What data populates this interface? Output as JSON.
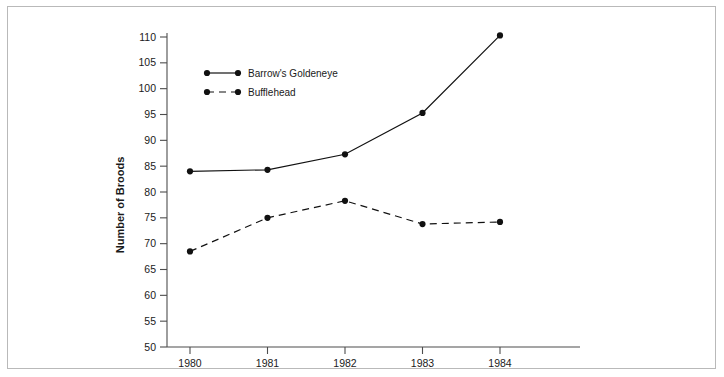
{
  "figure": {
    "background_color": "#ffffff",
    "frame_color": "#b9b9b9",
    "ink_color": "#111111"
  },
  "chart_data": {
    "type": "line",
    "title": "",
    "xlabel": "",
    "ylabel": "Number of Broods",
    "x": [
      1980,
      1981,
      1982,
      1983,
      1984
    ],
    "categories": [
      "1980",
      "1981",
      "1982",
      "1983",
      "1984"
    ],
    "xlim": [
      1979.55,
      1985.05
    ],
    "ylim": [
      50,
      112
    ],
    "yticks": [
      50,
      55,
      60,
      65,
      70,
      75,
      80,
      85,
      90,
      95,
      100,
      105,
      110
    ],
    "ytick_labels": [
      "50",
      "55",
      "60",
      "65",
      "70",
      "75",
      "80",
      "85",
      "90",
      "95",
      "100",
      "105",
      "110"
    ],
    "xticks": [
      1980,
      1981,
      1982,
      1983,
      1984
    ],
    "xtick_labels": [
      "1980",
      "1981",
      "1982",
      "1983",
      "1984"
    ],
    "grid": false,
    "legend_position": "upper left inside",
    "series": [
      {
        "name": "Barrow's Goldeneye",
        "linestyle": "solid",
        "marker": "filled-circle",
        "color": "#111111",
        "values": [
          84.0,
          84.3,
          87.3,
          95.3,
          110.3
        ]
      },
      {
        "name": "Bufflehead",
        "linestyle": "dashed",
        "marker": "filled-circle",
        "color": "#111111",
        "values": [
          68.5,
          75.0,
          78.3,
          73.8,
          74.2
        ]
      }
    ]
  },
  "legend": {
    "entries": [
      {
        "label": "Barrow's Goldeneye",
        "style": "solid"
      },
      {
        "label": "Bufflehead",
        "style": "dashed"
      }
    ]
  }
}
